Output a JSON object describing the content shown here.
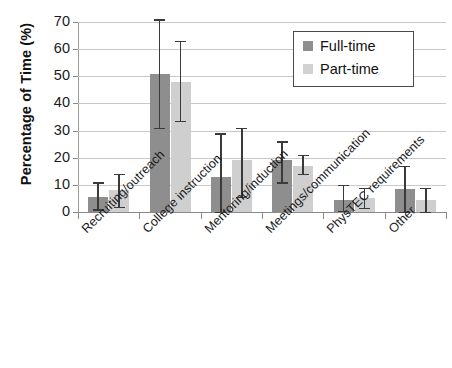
{
  "chart_data": {
    "type": "bar",
    "title": "",
    "xlabel": "",
    "ylabel": "Percentage of Time (%)",
    "ylim": [
      0,
      70
    ],
    "yticks": [
      0,
      10,
      20,
      30,
      40,
      50,
      60,
      70
    ],
    "grid": true,
    "legend_position": "top-right",
    "categories": [
      "Recruiting/outreach",
      "College instruction",
      "Mentoring/induction",
      "Meetings/communication",
      "PhysTEC requirements",
      "Other"
    ],
    "series": [
      {
        "name": "Full-time",
        "color": "#8e8e8e",
        "values": [
          5.5,
          51,
          13,
          19,
          4.5,
          8.5
        ],
        "error_low": [
          1,
          31,
          0,
          11,
          0.5,
          0
        ],
        "error_high": [
          11,
          71,
          29,
          26,
          10,
          17
        ]
      },
      {
        "name": "Part-time",
        "color": "#cfcfcf",
        "values": [
          8,
          48,
          19,
          17,
          5,
          4.5
        ],
        "error_low": [
          2,
          33.5,
          5.5,
          14,
          1.5,
          0
        ],
        "error_high": [
          14,
          63,
          31,
          21,
          9,
          9
        ]
      }
    ]
  },
  "axis": {
    "y_title": "Percentage of Time (%)"
  },
  "legend": {
    "entries": [
      {
        "label": "Full-time",
        "swatch": "full-time-swatch"
      },
      {
        "label": "Part-time",
        "swatch": "part-time-swatch"
      }
    ]
  }
}
